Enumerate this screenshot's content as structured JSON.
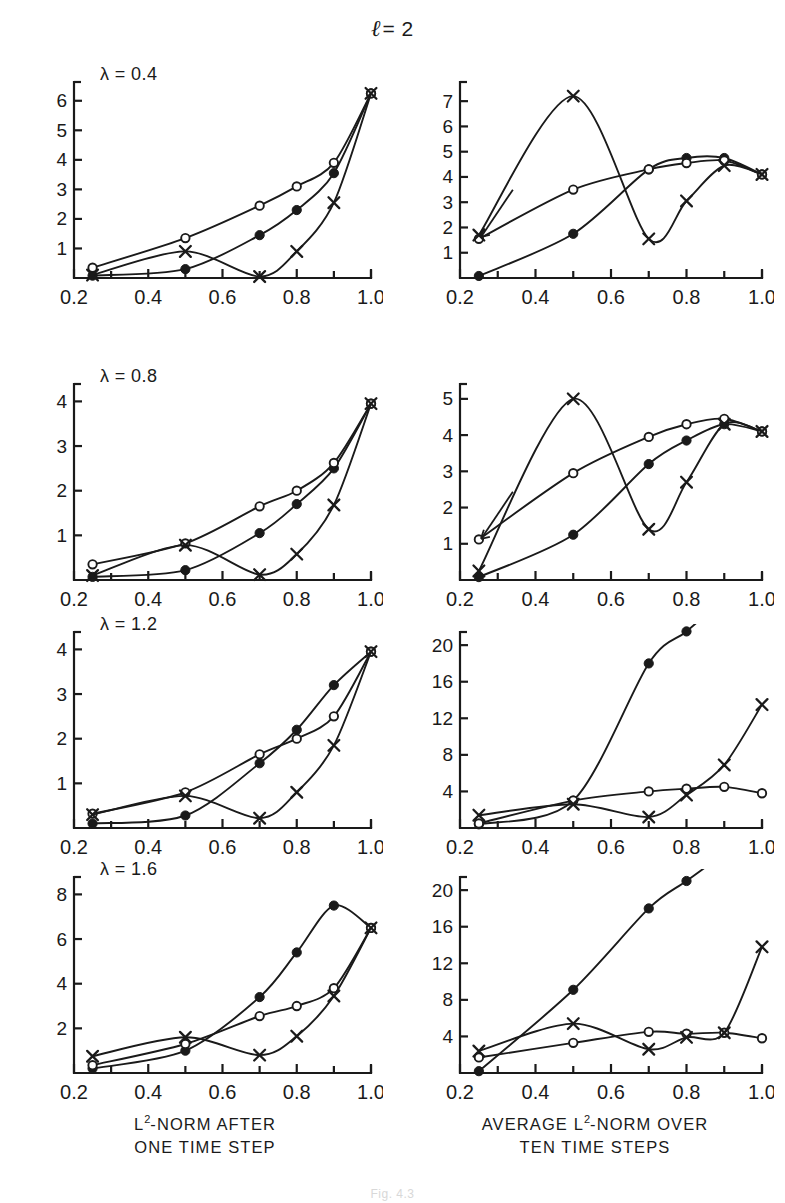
{
  "figure": {
    "title_symbol": "ℓ",
    "title_rest": "= 2",
    "caption": "Fig. 4.3"
  },
  "axis_captions": {
    "left_line1_pre": "L",
    "left_line1_sup": "2",
    "left_line1_post": "-NORM AFTER",
    "left_line2": "ONE TIME STEP",
    "right_line1_pre": "AVERAGE L",
    "right_line1_sup": "2",
    "right_line1_post": "-NORM OVER",
    "right_line2": "TEN TIME STEPS"
  },
  "style": {
    "ink": "#1a1a1a",
    "background": "#ffffff"
  },
  "chart_data": [
    {
      "id": "panel-l04-one-step",
      "type": "line",
      "title": "λ = 0.4",
      "column": "left",
      "row": 0,
      "xlabel": "L2-NORM AFTER ONE TIME STEP",
      "ylabel": "",
      "xlim": [
        0.2,
        1.0
      ],
      "ylim": [
        0,
        6.5
      ],
      "xticks": [
        0.2,
        0.4,
        0.6,
        0.8,
        1.0
      ],
      "xticklabels": [
        "0.2",
        "0.4",
        "0.6",
        "0.8",
        "1.0"
      ],
      "yticks": [
        1,
        2,
        3,
        4,
        5,
        6
      ],
      "yticklabels": [
        "1",
        "2",
        "3",
        "4",
        "5",
        "6"
      ],
      "grid": false,
      "legend": "none",
      "series": [
        {
          "name": "filled-circle",
          "marker": "filled-circle",
          "x": [
            0.25,
            0.5,
            0.7,
            0.8,
            0.9,
            1.0
          ],
          "y": [
            0.08,
            0.3,
            1.45,
            2.3,
            3.55,
            6.25
          ]
        },
        {
          "name": "open-circle",
          "marker": "open-circle",
          "x": [
            0.25,
            0.5,
            0.7,
            0.8,
            0.9,
            1.0
          ],
          "y": [
            0.35,
            1.35,
            2.45,
            3.1,
            3.9,
            6.25
          ]
        },
        {
          "name": "cross",
          "marker": "cross",
          "x": [
            0.25,
            0.5,
            0.7,
            0.8,
            0.9,
            1.0
          ],
          "y": [
            0.1,
            0.9,
            0.05,
            0.9,
            2.55,
            6.25
          ]
        }
      ]
    },
    {
      "id": "panel-l04-ten-step",
      "type": "line",
      "title": "",
      "column": "right",
      "row": 0,
      "xlabel": "AVERAGE L2-NORM OVER TEN TIME STEPS",
      "ylabel": "",
      "xlim": [
        0.2,
        1.0
      ],
      "ylim": [
        0,
        7.6
      ],
      "xticks": [
        0.2,
        0.4,
        0.6,
        0.8,
        1.0
      ],
      "xticklabels": [
        "0.2",
        "0.4",
        "0.6",
        "0.8",
        "1.0"
      ],
      "yticks": [
        1,
        2,
        3,
        4,
        5,
        6,
        7
      ],
      "yticklabels": [
        "1",
        "2",
        "3",
        "4",
        "5",
        "6",
        "7"
      ],
      "grid": false,
      "legend": "none",
      "annotation": "arrow pointing to x=0.25 markers",
      "series": [
        {
          "name": "filled-circle",
          "marker": "filled-circle",
          "x": [
            0.25,
            0.5,
            0.7,
            0.8,
            0.9,
            1.0
          ],
          "y": [
            0.08,
            1.75,
            4.3,
            4.75,
            4.75,
            4.1
          ]
        },
        {
          "name": "open-circle",
          "marker": "open-circle",
          "x": [
            0.25,
            0.5,
            0.7,
            0.8,
            0.9,
            1.0
          ],
          "y": [
            1.55,
            3.5,
            4.3,
            4.55,
            4.65,
            4.1
          ]
        },
        {
          "name": "cross",
          "marker": "cross",
          "x": [
            0.25,
            0.5,
            0.7,
            0.8,
            0.9,
            1.0
          ],
          "y": [
            1.7,
            7.2,
            1.55,
            3.05,
            4.45,
            4.1
          ]
        }
      ]
    },
    {
      "id": "panel-l08-one-step",
      "type": "line",
      "title": "λ = 0.8",
      "column": "left",
      "row": 1,
      "xlabel": "L2-NORM AFTER ONE TIME STEP",
      "ylabel": "",
      "xlim": [
        0.2,
        1.0
      ],
      "ylim": [
        0,
        4.3
      ],
      "xticks": [
        0.2,
        0.4,
        0.6,
        0.8,
        1.0
      ],
      "xticklabels": [
        "0.2",
        "0.4",
        "0.6",
        "0.8",
        "1.0"
      ],
      "yticks": [
        1,
        2,
        3,
        4
      ],
      "yticklabels": [
        "1",
        "2",
        "3",
        "4"
      ],
      "grid": false,
      "legend": "none",
      "series": [
        {
          "name": "filled-circle",
          "marker": "filled-circle",
          "x": [
            0.25,
            0.5,
            0.7,
            0.8,
            0.9,
            1.0
          ],
          "y": [
            0.07,
            0.22,
            1.05,
            1.7,
            2.5,
            3.95
          ]
        },
        {
          "name": "open-circle",
          "marker": "open-circle",
          "x": [
            0.25,
            0.5,
            0.7,
            0.8,
            0.9,
            1.0
          ],
          "y": [
            0.35,
            0.82,
            1.65,
            2.0,
            2.62,
            3.95
          ]
        },
        {
          "name": "cross",
          "marker": "cross",
          "x": [
            0.25,
            0.5,
            0.7,
            0.8,
            0.9,
            1.0
          ],
          "y": [
            0.1,
            0.78,
            0.12,
            0.58,
            1.68,
            3.95
          ]
        }
      ]
    },
    {
      "id": "panel-l08-ten-step",
      "type": "line",
      "title": "",
      "column": "right",
      "row": 1,
      "xlabel": "AVERAGE L2-NORM OVER TEN TIME STEPS",
      "ylabel": "",
      "xlim": [
        0.2,
        1.0
      ],
      "ylim": [
        0,
        5.3
      ],
      "xticks": [
        0.2,
        0.4,
        0.6,
        0.8,
        1.0
      ],
      "xticklabels": [
        "0.2",
        "0.4",
        "0.6",
        "0.8",
        "1.0"
      ],
      "yticks": [
        1,
        2,
        3,
        4,
        5
      ],
      "yticklabels": [
        "1",
        "2",
        "3",
        "4",
        "5"
      ],
      "grid": false,
      "legend": "none",
      "annotation": "arrow pointing to x=0.25 markers",
      "series": [
        {
          "name": "filled-circle",
          "marker": "filled-circle",
          "x": [
            0.25,
            0.5,
            0.7,
            0.8,
            0.9,
            1.0
          ],
          "y": [
            0.08,
            1.25,
            3.2,
            3.85,
            4.3,
            4.1
          ]
        },
        {
          "name": "open-circle",
          "marker": "open-circle",
          "x": [
            0.25,
            0.5,
            0.7,
            0.8,
            0.9,
            1.0
          ],
          "y": [
            1.12,
            2.95,
            3.95,
            4.3,
            4.45,
            4.1
          ]
        },
        {
          "name": "cross",
          "marker": "cross",
          "x": [
            0.25,
            0.5,
            0.7,
            0.8,
            0.9,
            1.0
          ],
          "y": [
            0.25,
            5.0,
            1.4,
            2.7,
            4.3,
            4.1
          ]
        }
      ]
    },
    {
      "id": "panel-l12-one-step",
      "type": "line",
      "title": "λ = 1.2",
      "column": "left",
      "row": 2,
      "xlabel": "L2-NORM AFTER ONE TIME STEP",
      "ylabel": "",
      "xlim": [
        0.2,
        1.0
      ],
      "ylim": [
        0,
        4.3
      ],
      "xticks": [
        0.2,
        0.4,
        0.6,
        0.8,
        1.0
      ],
      "xticklabels": [
        "0.2",
        "0.4",
        "0.6",
        "0.8",
        "1.0"
      ],
      "yticks": [
        1,
        2,
        3,
        4
      ],
      "yticklabels": [
        "1",
        "2",
        "3",
        "4"
      ],
      "grid": false,
      "legend": "none",
      "series": [
        {
          "name": "filled-circle",
          "marker": "filled-circle",
          "x": [
            0.25,
            0.5,
            0.7,
            0.8,
            0.9,
            1.0
          ],
          "y": [
            0.1,
            0.28,
            1.45,
            2.2,
            3.2,
            3.95
          ]
        },
        {
          "name": "open-circle",
          "marker": "open-circle",
          "x": [
            0.25,
            0.5,
            0.7,
            0.8,
            0.9,
            1.0
          ],
          "y": [
            0.32,
            0.8,
            1.65,
            2.0,
            2.5,
            3.95
          ]
        },
        {
          "name": "cross",
          "marker": "cross",
          "x": [
            0.25,
            0.5,
            0.7,
            0.8,
            0.9,
            1.0
          ],
          "y": [
            0.3,
            0.72,
            0.22,
            0.8,
            1.85,
            3.95
          ]
        }
      ]
    },
    {
      "id": "panel-l12-ten-step",
      "type": "line",
      "title": "",
      "column": "right",
      "row": 2,
      "xlabel": "AVERAGE L2-NORM OVER TEN TIME STEPS",
      "ylabel": "",
      "xlim": [
        0.2,
        1.0
      ],
      "ylim": [
        0,
        21
      ],
      "xticks": [
        0.2,
        0.4,
        0.6,
        0.8,
        1.0
      ],
      "xticklabels": [
        "0.2",
        "0.4",
        "0.6",
        "0.8",
        "1.0"
      ],
      "yticks": [
        4,
        8,
        12,
        16,
        20
      ],
      "yticklabels": [
        "4",
        "8",
        "12",
        "16",
        "20"
      ],
      "grid": false,
      "legend": "none",
      "series": [
        {
          "name": "filled-circle",
          "marker": "filled-circle",
          "x": [
            0.25,
            0.5,
            0.7,
            0.8,
            0.9,
            1.0
          ],
          "y": [
            0.4,
            3.0,
            18.0,
            21.5,
            25.0,
            28.0
          ]
        },
        {
          "name": "open-circle",
          "marker": "open-circle",
          "x": [
            0.25,
            0.5,
            0.7,
            0.8,
            0.9,
            1.0
          ],
          "y": [
            0.5,
            3.0,
            4.0,
            4.3,
            4.5,
            3.8
          ]
        },
        {
          "name": "cross",
          "marker": "cross",
          "x": [
            0.25,
            0.5,
            0.7,
            0.8,
            0.9,
            1.0
          ],
          "y": [
            1.4,
            2.6,
            1.2,
            3.6,
            6.9,
            13.5
          ]
        }
      ]
    },
    {
      "id": "panel-l16-one-step",
      "type": "line",
      "title": "λ = 1.6",
      "column": "left",
      "row": 3,
      "xlabel": "L2-NORM AFTER ONE TIME STEP",
      "ylabel": "",
      "xlim": [
        0.2,
        1.0
      ],
      "ylim": [
        0,
        8.6
      ],
      "xticks": [
        0.2,
        0.4,
        0.6,
        0.8,
        1.0
      ],
      "xticklabels": [
        "0.2",
        "0.4",
        "0.6",
        "0.8",
        "1.0"
      ],
      "yticks": [
        2,
        4,
        6,
        8
      ],
      "yticklabels": [
        "2",
        "4",
        "6",
        "8"
      ],
      "grid": false,
      "legend": "none",
      "series": [
        {
          "name": "filled-circle",
          "marker": "filled-circle",
          "x": [
            0.25,
            0.5,
            0.7,
            0.8,
            0.9,
            1.0
          ],
          "y": [
            0.2,
            1.0,
            3.4,
            5.4,
            7.5,
            6.5
          ]
        },
        {
          "name": "open-circle",
          "marker": "open-circle",
          "x": [
            0.25,
            0.5,
            0.7,
            0.8,
            0.9,
            1.0
          ],
          "y": [
            0.35,
            1.3,
            2.55,
            3.0,
            3.8,
            6.5
          ]
        },
        {
          "name": "cross",
          "marker": "cross",
          "x": [
            0.25,
            0.5,
            0.7,
            0.8,
            0.9,
            1.0
          ],
          "y": [
            0.75,
            1.6,
            0.8,
            1.65,
            3.45,
            6.5
          ]
        }
      ]
    },
    {
      "id": "panel-l16-ten-step",
      "type": "line",
      "title": "",
      "column": "right",
      "row": 3,
      "xlabel": "AVERAGE L2-NORM OVER TEN TIME STEPS",
      "ylabel": "",
      "xlim": [
        0.2,
        1.0
      ],
      "ylim": [
        0,
        21
      ],
      "xticks": [
        0.2,
        0.4,
        0.6,
        0.8,
        1.0
      ],
      "xticklabels": [
        "0.2",
        "0.4",
        "0.6",
        "0.8",
        "1.0"
      ],
      "yticks": [
        4,
        8,
        12,
        16,
        20
      ],
      "yticklabels": [
        "4",
        "8",
        "12",
        "16",
        "20"
      ],
      "grid": false,
      "legend": "none",
      "series": [
        {
          "name": "filled-circle",
          "marker": "filled-circle",
          "x": [
            0.25,
            0.5,
            0.7,
            0.8,
            0.9,
            1.0
          ],
          "y": [
            0.2,
            9.1,
            18.0,
            21.0,
            24.0,
            27.0
          ]
        },
        {
          "name": "open-circle",
          "marker": "open-circle",
          "x": [
            0.25,
            0.5,
            0.7,
            0.8,
            0.9,
            1.0
          ],
          "y": [
            1.7,
            3.3,
            4.5,
            4.3,
            4.4,
            3.8
          ]
        },
        {
          "name": "cross",
          "marker": "cross",
          "x": [
            0.25,
            0.5,
            0.7,
            0.8,
            0.9,
            1.0
          ],
          "y": [
            2.4,
            5.4,
            2.6,
            3.9,
            4.4,
            13.8
          ]
        }
      ]
    }
  ]
}
